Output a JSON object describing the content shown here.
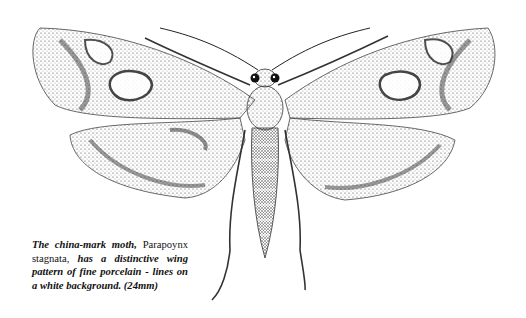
{
  "figure": {
    "caption": {
      "part1": "The china-mark moth,",
      "part2": " Parapoynx stagnata,",
      "part3": " has a distinctive wing pattern of fine porcelain - lines on a white background.",
      "part4": " (24mm)"
    },
    "colors": {
      "ink": "#1a1a1a",
      "background": "#ffffff"
    }
  }
}
